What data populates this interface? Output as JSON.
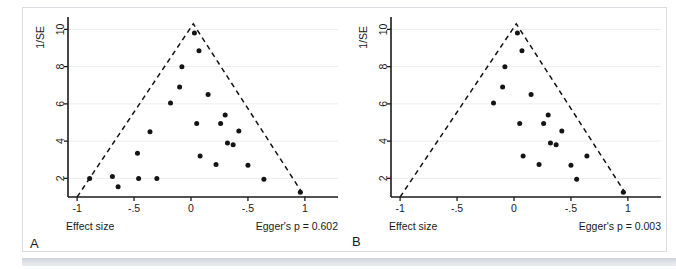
{
  "figure": {
    "panel_labels": [
      "A",
      "B"
    ],
    "background_color": "#ffffff",
    "border_color": "#d9dde1",
    "point_color": "#141414",
    "gridline_color": "#ececec",
    "axis_color": "#1a1a1a"
  },
  "chart_data": [
    {
      "type": "scatter",
      "title": "",
      "panel": "A",
      "xlabel": "Effect size",
      "ylabel": "1/SE",
      "xlim": [
        -1.08,
        1.08
      ],
      "ylim": [
        1.0,
        10.45
      ],
      "xticks": [
        -1,
        -0.5,
        0,
        0.5,
        1
      ],
      "xticklabels": [
        "-1",
        "-.5",
        "0",
        "-.5",
        "1"
      ],
      "yticks": [
        2,
        4,
        6,
        8,
        10
      ],
      "yticklabels": [
        "2",
        "4",
        "6",
        "8",
        "10"
      ],
      "grid": true,
      "grid_axis": "y",
      "legend": "none",
      "annotation": "Egger's p = 0.602",
      "funnel": {
        "apex_x": 0.02,
        "apex_y": 10.3,
        "left_base_x": -1.0,
        "right_base_x": 1.0,
        "base_y": 1.0,
        "style": "dashed"
      },
      "x": [
        0.03,
        0.07,
        -0.08,
        -0.1,
        -0.18,
        0.15,
        0.3,
        0.26,
        0.05,
        0.42,
        0.32,
        0.37,
        -0.36,
        -0.47,
        -0.3,
        0.08,
        0.22,
        0.5,
        0.64,
        -0.89,
        -0.69,
        -0.46,
        -0.64,
        0.96
      ],
      "y": [
        9.8,
        8.85,
        8.0,
        6.9,
        6.05,
        6.5,
        5.4,
        4.95,
        4.95,
        4.55,
        3.9,
        3.8,
        4.5,
        3.35,
        2.0,
        3.2,
        2.75,
        2.7,
        1.95,
        2.0,
        2.1,
        2.0,
        1.55,
        1.25
      ],
      "n_points": 24
    },
    {
      "type": "scatter",
      "title": "",
      "panel": "B",
      "xlabel": "Effect size",
      "ylabel": "1/SE",
      "xlim": [
        -1.08,
        1.08
      ],
      "ylim": [
        1.0,
        10.45
      ],
      "xticks": [
        -1,
        -0.5,
        0,
        0.5,
        1
      ],
      "xticklabels": [
        "-1",
        "-.5",
        "0",
        "-.5",
        "1"
      ],
      "yticks": [
        2,
        4,
        6,
        8,
        10
      ],
      "yticklabels": [
        "2",
        "4",
        "6",
        "8",
        "10"
      ],
      "grid": true,
      "grid_axis": "y",
      "legend": "none",
      "annotation": "Egger's p = 0.003",
      "funnel": {
        "apex_x": 0.02,
        "apex_y": 10.3,
        "left_base_x": -1.0,
        "right_base_x": 1.0,
        "base_y": 1.0,
        "style": "dashed"
      },
      "x": [
        0.03,
        0.07,
        -0.08,
        -0.1,
        -0.18,
        0.15,
        0.3,
        0.26,
        0.05,
        0.42,
        0.32,
        0.37,
        0.08,
        0.22,
        0.5,
        0.64,
        0.55,
        0.96
      ],
      "y": [
        9.8,
        8.85,
        8.0,
        6.9,
        6.05,
        6.5,
        5.4,
        4.95,
        4.95,
        4.55,
        3.9,
        3.8,
        3.2,
        2.75,
        2.7,
        3.2,
        1.95,
        1.25
      ],
      "n_points": 18
    }
  ]
}
